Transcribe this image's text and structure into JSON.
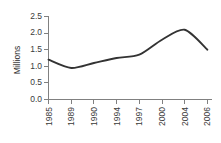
{
  "chart_data": {
    "type": "line",
    "title": "",
    "xlabel": "",
    "ylabel": "Millions",
    "categories": [
      "1985",
      "1989",
      "1990",
      "1994",
      "1997",
      "2000",
      "2004",
      "2006"
    ],
    "values": [
      1.2,
      0.95,
      1.1,
      1.25,
      1.35,
      1.8,
      2.1,
      1.5
    ],
    "series": [
      {
        "name": "",
        "values": [
          1.2,
          0.95,
          1.1,
          1.25,
          1.35,
          1.8,
          2.1,
          1.5
        ]
      }
    ],
    "ylim": [
      0.0,
      2.5
    ],
    "yticks": [
      "0.0",
      "0.5",
      "1.0",
      "1.5",
      "2.0",
      "2.5"
    ],
    "ytick_values": [
      0.0,
      0.5,
      1.0,
      1.5,
      2.0,
      2.5
    ],
    "xtick_labels": [
      "1985",
      "1989",
      "1990",
      "1994",
      "1997",
      "2000",
      "2004",
      "2006"
    ],
    "grid": false,
    "legend": false,
    "legend_position": "none",
    "line_color": "#333333",
    "axis_color": "#808080",
    "background_color": "#ffffff",
    "xtick_label_rotation": "90"
  }
}
